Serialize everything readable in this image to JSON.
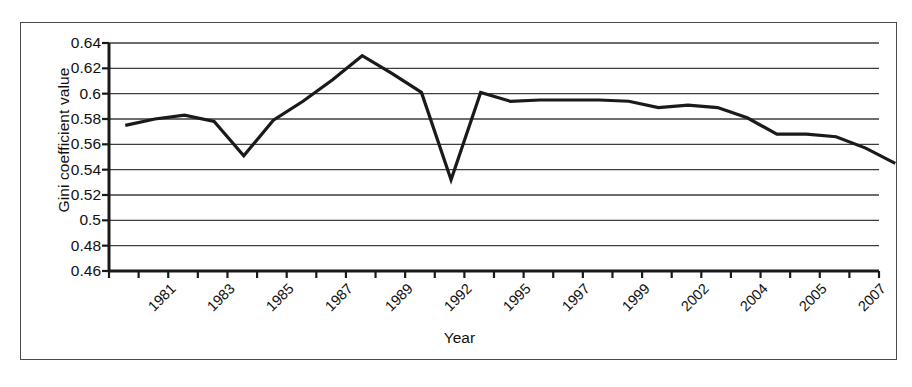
{
  "chart_data": {
    "type": "line",
    "title": "",
    "xlabel": "Year",
    "ylabel": "Gini coefficient value",
    "ylim": [
      0.46,
      0.64
    ],
    "ytick_step": 0.02,
    "yticks": [
      "0.64",
      "0.62",
      "0.6",
      "0.58",
      "0.56",
      "0.54",
      "0.52",
      "0.5",
      "0.48",
      "0.46"
    ],
    "xtick_labels": [
      "1981",
      "1983",
      "1985",
      "1987",
      "1989",
      "1992",
      "1995",
      "1997",
      "1999",
      "2002",
      "2004",
      "2005",
      "2007"
    ],
    "xtick_count": 26,
    "grid": "horizontal",
    "legend": "none",
    "line_color": "#1a1a1a",
    "series": [
      {
        "name": "Gini coefficient",
        "x": [
          1982,
          1983,
          1984,
          1985,
          1986,
          1987,
          1988,
          1989,
          1990,
          1991,
          1992,
          1993,
          1994,
          1995,
          1996,
          1997,
          1998,
          1999,
          2000,
          2001,
          2002,
          2003,
          2004,
          2005,
          2006,
          2007,
          2008
        ],
        "values": [
          0.575,
          0.58,
          0.583,
          0.578,
          0.551,
          0.579,
          0.594,
          0.611,
          0.63,
          0.616,
          0.601,
          0.532,
          0.601,
          0.594,
          0.595,
          0.595,
          0.595,
          0.594,
          0.589,
          0.591,
          0.589,
          0.581,
          0.568,
          0.568,
          0.566,
          0.557,
          0.545
        ]
      }
    ]
  },
  "axis": {
    "y_title": "Gini coefficient value",
    "x_title": "Year"
  },
  "caption": {
    "text": ""
  }
}
